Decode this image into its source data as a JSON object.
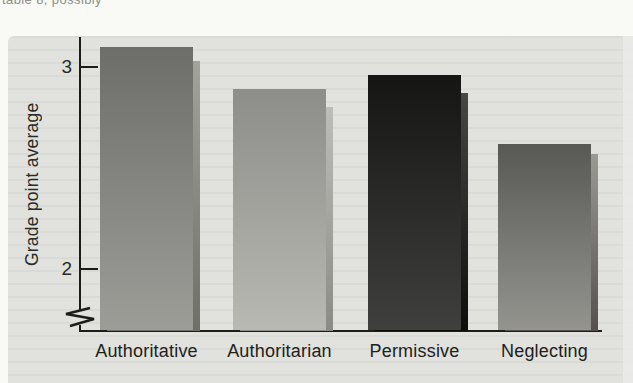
{
  "page": {
    "caption_fragment": "table 8, possibly"
  },
  "chart_data": {
    "type": "bar",
    "title": "",
    "categories": [
      "Authoritative",
      "Authoritarian",
      "Permissive",
      "Neglecting"
    ],
    "values": [
      3.1,
      2.89,
      2.96,
      2.62
    ],
    "shadow_values": [
      3.03,
      2.8,
      2.87,
      2.57
    ],
    "ylabel": "Grade point average",
    "xlabel": "",
    "yticks": [
      3,
      2
    ],
    "ylim": [
      2,
      3
    ],
    "axis_break": true,
    "grid": false,
    "legend": "none",
    "axis_color": "#1c1c1a",
    "panel_bg": "#e1e2de",
    "bar_colors": [
      {
        "top": "#6d6d6a",
        "bottom": "#9d9d98",
        "shadow_top": "#a3a39e",
        "shadow_bottom": "#6f6f6a"
      },
      {
        "top": "#8d8d89",
        "bottom": "#b9b9b3",
        "shadow_top": "#bebeb8",
        "shadow_bottom": "#8b8b86"
      },
      {
        "top": "#151513",
        "bottom": "#3f3f3d",
        "shadow_top": "#474745",
        "shadow_bottom": "#0d0d0b"
      },
      {
        "top": "#585855",
        "bottom": "#94948f",
        "shadow_top": "#9a9a95",
        "shadow_bottom": "#55504f"
      }
    ]
  }
}
